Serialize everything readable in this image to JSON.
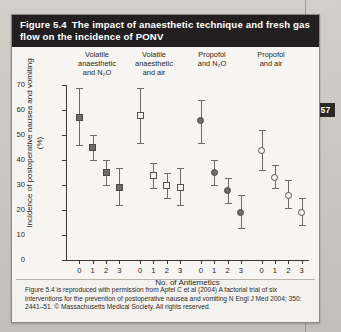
{
  "page": {
    "page_number": "57"
  },
  "figure": {
    "number": "Figure 5.4",
    "title": "The impact of anaesthetic technique and fresh gas flow on the incidence of PONV",
    "caption": "Figure 5.4 is reproduced with permission from Apfel C et al (2004) A factorial trial of six interventions for the prevention of postoperative nausea and vomiting N Engl J Med 2004; 350: 2441–51. © Massachusetts Medical Society. All rights reserved."
  },
  "chart_data": {
    "type": "scatter",
    "title": "The impact of anaesthetic technique and fresh gas flow on the incidence of PONV",
    "xlabel": "No. of Antiemetics",
    "ylabel": "Incidence of postoperative nausea and vomiting (%)",
    "ylim": [
      0,
      70
    ],
    "yticks": [
      0,
      10,
      20,
      30,
      40,
      50,
      60,
      70
    ],
    "xticks": [
      "0",
      "1",
      "2",
      "3",
      "0",
      "1",
      "2",
      "3",
      "0",
      "1",
      "2",
      "3",
      "0",
      "1",
      "2",
      "3"
    ],
    "grid": false,
    "legend": "none",
    "group_headers": [
      {
        "line1": "Volatile",
        "line2": "anaesthetic",
        "line3": "and N₂O"
      },
      {
        "line1": "Volatile",
        "line2": "anaesthetic",
        "line3": "and air"
      },
      {
        "line1": "Propofol",
        "line2": "and N₂O",
        "line3": ""
      },
      {
        "line1": "Propofol",
        "line2": "and air",
        "line3": ""
      }
    ],
    "series": [
      {
        "name": "Volatile anaesthetic and N2O",
        "marker": "filled-square",
        "x": [
          "0",
          "1",
          "2",
          "3"
        ],
        "values": [
          57,
          45,
          35,
          29
        ],
        "ci_low": [
          46,
          40,
          30,
          22
        ],
        "ci_high": [
          69,
          50,
          40,
          37
        ]
      },
      {
        "name": "Volatile anaesthetic and air",
        "marker": "open-square",
        "x": [
          "0",
          "1",
          "2",
          "3"
        ],
        "values": [
          58,
          34,
          30,
          29
        ],
        "ci_low": [
          47,
          29,
          25,
          22
        ],
        "ci_high": [
          69,
          39,
          35,
          37
        ]
      },
      {
        "name": "Propofol and N2O",
        "marker": "filled-circle",
        "x": [
          "0",
          "1",
          "2",
          "3"
        ],
        "values": [
          56,
          35,
          28,
          19
        ],
        "ci_low": [
          47,
          30,
          23,
          13
        ],
        "ci_high": [
          64,
          40,
          33,
          26
        ]
      },
      {
        "name": "Propofol and air",
        "marker": "open-circle",
        "x": [
          "0",
          "1",
          "2",
          "3"
        ],
        "values": [
          44,
          33,
          26,
          19
        ],
        "ci_low": [
          36,
          29,
          21,
          14
        ],
        "ci_high": [
          52,
          38,
          32,
          25
        ]
      }
    ]
  }
}
